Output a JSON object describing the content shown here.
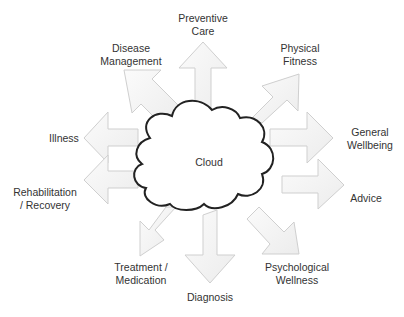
{
  "diagram": {
    "center": {
      "label": "Cloud",
      "shape": "cloud"
    },
    "nodes": [
      {
        "id": "preventive-care",
        "lines": [
          "Preventive",
          "Care"
        ],
        "direction": "up"
      },
      {
        "id": "physical-fitness",
        "lines": [
          "Physical",
          "Fitness"
        ],
        "direction": "up-right"
      },
      {
        "id": "general-wellbeing",
        "lines": [
          "General",
          "Wellbeing"
        ],
        "direction": "right"
      },
      {
        "id": "advice",
        "lines": [
          "Advice"
        ],
        "direction": "right"
      },
      {
        "id": "psychological-wellness",
        "lines": [
          "Psychological",
          "Wellness"
        ],
        "direction": "down-right"
      },
      {
        "id": "diagnosis",
        "lines": [
          "Diagnosis"
        ],
        "direction": "down"
      },
      {
        "id": "treatment-medication",
        "lines": [
          "Treatment /",
          "Medication"
        ],
        "direction": "down-left"
      },
      {
        "id": "rehabilitation-recovery",
        "lines": [
          "Rehabilitation",
          "/ Recovery"
        ],
        "direction": "left"
      },
      {
        "id": "illness",
        "lines": [
          "Illness"
        ],
        "direction": "left"
      },
      {
        "id": "disease-management",
        "lines": [
          "Disease",
          "Management"
        ],
        "direction": "up-left"
      }
    ],
    "colors": {
      "arrow_fill": "#f4f4f4",
      "arrow_stroke": "#cfcfcf",
      "cloud_stroke": "#222222",
      "text": "#333333"
    }
  }
}
